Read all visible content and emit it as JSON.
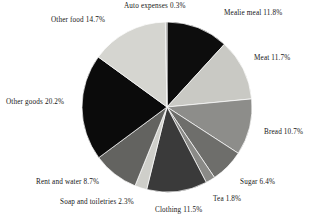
{
  "chart_data": {
    "type": "pie",
    "title": "",
    "subtitle": "",
    "xlabel": "",
    "ylabel": "",
    "grid": false,
    "legend_position": "none",
    "label_format": "{name} {value}%",
    "start_angle_deg": 0,
    "direction": "clockwise",
    "center": {
      "x": 167,
      "y": 107
    },
    "radius": 85,
    "categories": [
      "Mealie meal",
      "Meat",
      "Bread",
      "Sugar",
      "Tea",
      "Clothing",
      "Soap and toiletries",
      "Rent and water",
      "Other goods",
      "Other food",
      "Auto expenses"
    ],
    "values": [
      11.8,
      11.7,
      10.7,
      6.4,
      1.8,
      11.5,
      2.3,
      8.7,
      20.2,
      14.7,
      0.3
    ],
    "total": 100.1,
    "colors": [
      "#0d0d0d",
      "#c9c9c4",
      "#8d8d8a",
      "#6e6e6b",
      "#8a8a87",
      "#3a3a3a",
      "#cfcfca",
      "#636360",
      "#0b0b0b",
      "#d5d5d0",
      "#9a9a97"
    ],
    "slices": [
      {
        "name": "Mealie meal",
        "value": 11.8,
        "label": "Mealie meal 11.8%",
        "color": "#0d0d0d"
      },
      {
        "name": "Meat",
        "value": 11.7,
        "label": "Meat 11.7%",
        "color": "#c9c9c4"
      },
      {
        "name": "Bread",
        "value": 10.7,
        "label": "Bread 10.7%",
        "color": "#8d8d8a"
      },
      {
        "name": "Sugar",
        "value": 6.4,
        "label": "Sugar 6.4%",
        "color": "#6e6e6b"
      },
      {
        "name": "Tea",
        "value": 1.8,
        "label": "Tea 1.8%",
        "color": "#8a8a87"
      },
      {
        "name": "Clothing",
        "value": 11.5,
        "label": "Clothing 11.5%",
        "color": "#3a3a3a"
      },
      {
        "name": "Soap and toiletries",
        "value": 2.3,
        "label": "Soap and toiletries 2.3%",
        "color": "#cfcfca"
      },
      {
        "name": "Rent and water",
        "value": 8.7,
        "label": "Rent and water 8.7%",
        "color": "#636360"
      },
      {
        "name": "Other goods",
        "value": 20.2,
        "label": "Other goods 20.2%",
        "color": "#0b0b0b"
      },
      {
        "name": "Other food",
        "value": 14.7,
        "label": "Other food 14.7%",
        "color": "#d5d5d0"
      },
      {
        "name": "Auto expenses",
        "value": 0.3,
        "label": "Auto expenses 0.3%",
        "color": "#9a9a97"
      }
    ]
  },
  "background_color": "#ffffff",
  "text_color": "#161616"
}
